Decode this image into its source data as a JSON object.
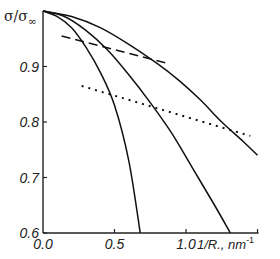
{
  "chart_data": {
    "type": "line",
    "title": "",
    "xlabel": "1/R., nm",
    "xlabel_sup": "-1",
    "ylabel": "σ/σ",
    "ylabel_sub": "∞",
    "xlim": [
      0.0,
      1.55
    ],
    "ylim": [
      0.6,
      1.0
    ],
    "x_ticks": [
      0.0,
      0.5,
      1.0,
      1.5
    ],
    "x_tick_labels": [
      "0.0",
      "0.5",
      "1.0",
      ""
    ],
    "y_ticks": [
      0.6,
      0.7,
      0.8,
      0.9
    ],
    "y_tick_labels": [
      "0.6",
      "0.7",
      "0.8",
      "0.9"
    ],
    "grid": false,
    "legend": null,
    "series": [
      {
        "name": "curve-1",
        "style": "solid",
        "x": [
          0,
          0.1,
          0.2,
          0.3,
          0.4,
          0.5,
          0.6,
          0.68
        ],
        "y": [
          1.0,
          0.99,
          0.97,
          0.935,
          0.89,
          0.83,
          0.73,
          0.6
        ]
      },
      {
        "name": "curve-2",
        "style": "solid",
        "x": [
          0,
          0.15,
          0.3,
          0.45,
          0.6,
          0.75,
          0.9,
          1.05,
          1.2,
          1.31
        ],
        "y": [
          1.0,
          0.99,
          0.965,
          0.93,
          0.885,
          0.835,
          0.78,
          0.715,
          0.65,
          0.6
        ]
      },
      {
        "name": "curve-3",
        "style": "solid",
        "x": [
          0,
          0.2,
          0.4,
          0.6,
          0.8,
          0.95,
          1.1,
          1.25,
          1.4,
          1.5
        ],
        "y": [
          1.0,
          0.99,
          0.97,
          0.94,
          0.905,
          0.875,
          0.84,
          0.8,
          0.765,
          0.74
        ]
      },
      {
        "name": "dashed-fit",
        "style": "dashed",
        "x": [
          0.13,
          0.88
        ],
        "y": [
          0.955,
          0.905
        ]
      },
      {
        "name": "dotted-fit",
        "style": "dotted",
        "x": [
          0.27,
          1.45
        ],
        "y": [
          0.865,
          0.775
        ]
      }
    ]
  }
}
